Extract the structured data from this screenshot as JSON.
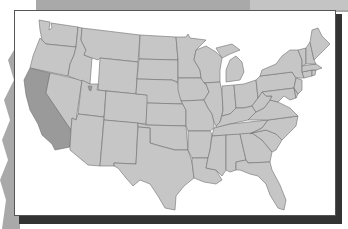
{
  "map": {
    "title": "United States map",
    "highlighted_state": "California",
    "colors": {
      "state_fill": "#c6c6c6",
      "state_border": "#6f6f6f",
      "highlight_fill": "#9a9a9a",
      "frame_background": "#ffffff",
      "frame_shadow": "#333333",
      "backdrop": "#a9a9a9"
    },
    "states": [
      "Washington",
      "Oregon",
      "California",
      "Nevada",
      "Idaho",
      "Montana",
      "Wyoming",
      "Utah",
      "Arizona",
      "Colorado",
      "New Mexico",
      "North Dakota",
      "South Dakota",
      "Nebraska",
      "Kansas",
      "Oklahoma",
      "Texas",
      "Minnesota",
      "Iowa",
      "Missouri",
      "Arkansas",
      "Louisiana",
      "Wisconsin",
      "Illinois",
      "Michigan",
      "Indiana",
      "Ohio",
      "Kentucky",
      "Tennessee",
      "Mississippi",
      "Alabama",
      "Georgia",
      "Florida",
      "South Carolina",
      "North Carolina",
      "Virginia",
      "West Virginia",
      "Pennsylvania",
      "New York",
      "Maryland",
      "Delaware",
      "New Jersey",
      "Connecticut",
      "Rhode Island",
      "Massachusetts",
      "Vermont",
      "New Hampshire",
      "Maine"
    ]
  }
}
